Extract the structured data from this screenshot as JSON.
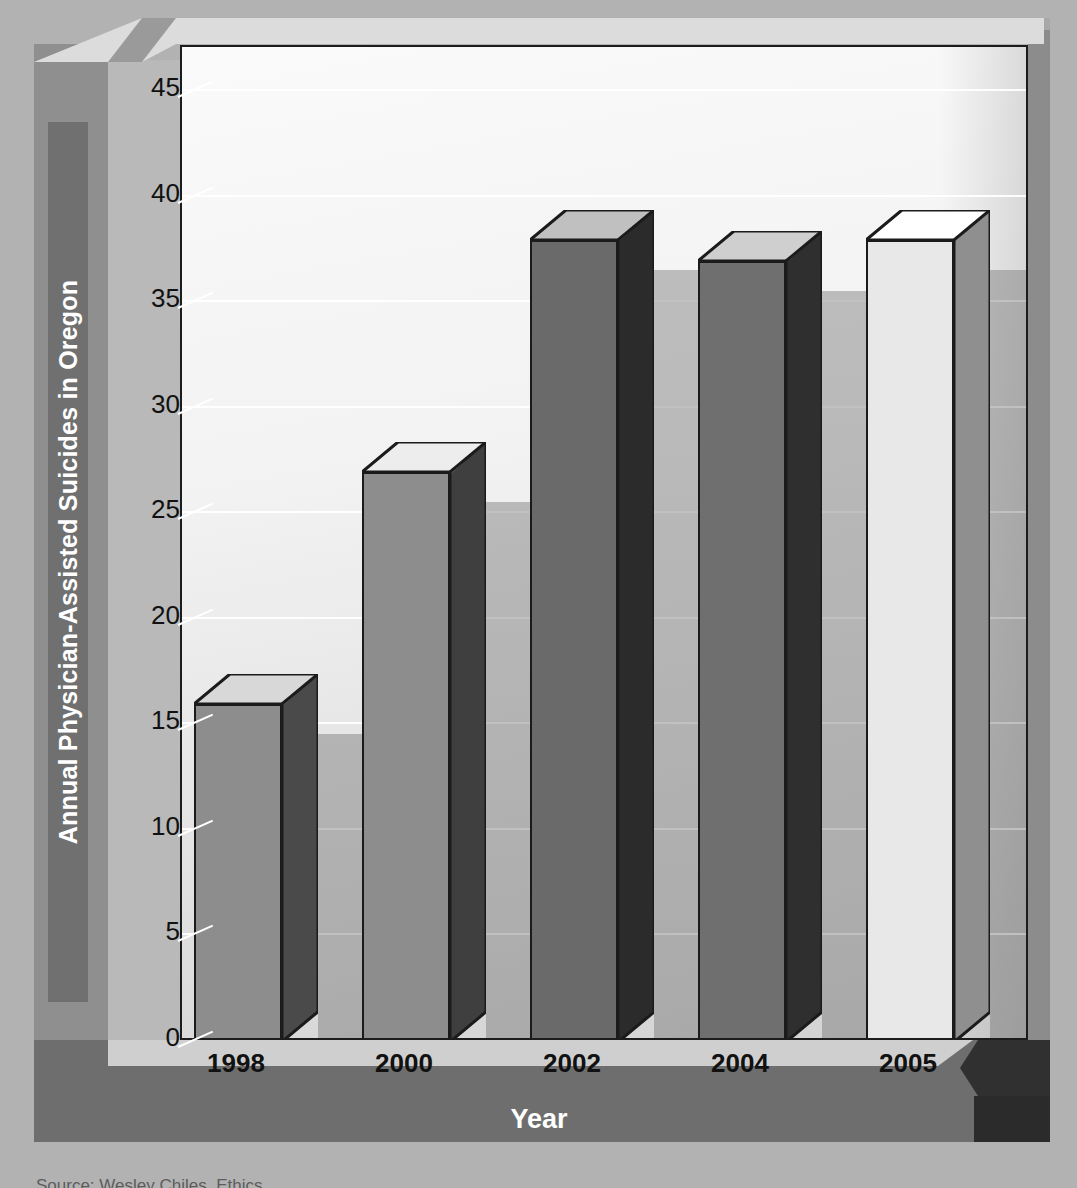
{
  "chart_data": {
    "type": "bar",
    "title": "",
    "categories": [
      "1998",
      "2000",
      "2002",
      "2004",
      "2005"
    ],
    "values": [
      16,
      27,
      38,
      37,
      38
    ],
    "xlabel": "Year",
    "ylabel": "Annual Physician-Assisted Suicides in Oregon",
    "ylim": [
      0,
      47
    ],
    "yticks": [
      0,
      5,
      10,
      15,
      20,
      25,
      30,
      35,
      40,
      45
    ],
    "ytick_labels": [
      "0",
      "5",
      "10",
      "15",
      "20",
      "25",
      "30",
      "35",
      "40",
      "45"
    ],
    "grid": true,
    "legend": "none",
    "style": "3d-bar",
    "bar_colors": [
      "#8d8d8d",
      "#8d8d8d",
      "#6a6a6a",
      "#6f6f6f",
      "#e8e8e8"
    ],
    "bar_side_colors": [
      "#4a4a4a",
      "#3f3f3f",
      "#2b2b2b",
      "#2f2f2f",
      "#8f8f8f"
    ],
    "bar_top_colors": [
      "#d8d8d8",
      "#ededed",
      "#c0c0c0",
      "#cfcfcf",
      "#ffffff"
    ]
  },
  "axes": {
    "y_title": "Annual Physician-Assisted Suicides in Oregon",
    "x_title": "Year"
  },
  "footer": {
    "source": "Source: Wesley Chiles, Ethics"
  },
  "colors": {
    "background": "#b2b2b2",
    "panel": "#f2f2f2",
    "axis_band": "#6e6e6e",
    "axis_text": "#ffffff",
    "tick_text": "#111111",
    "gridline": "#ffffff",
    "outline": "#1b1b1b"
  }
}
